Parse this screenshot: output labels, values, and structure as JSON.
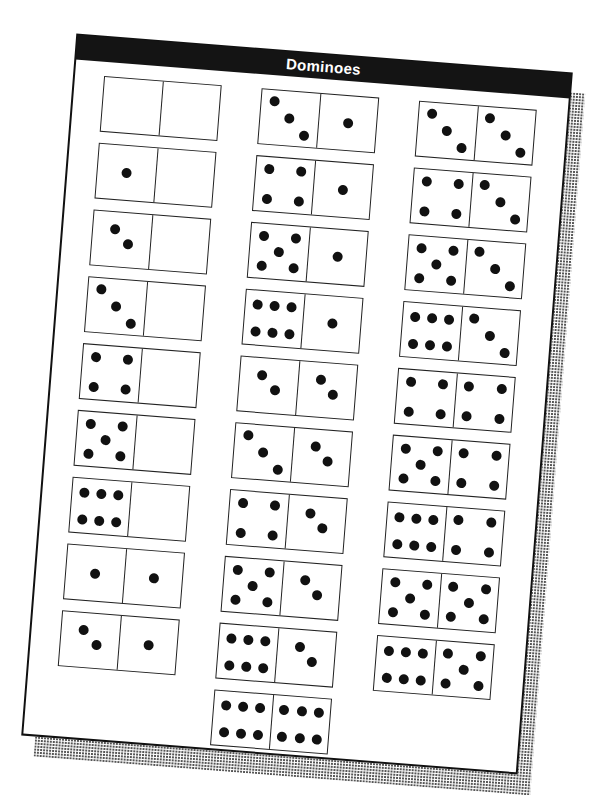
{
  "sheet": {
    "title": "Dominoes",
    "header_color": "#141414",
    "title_color": "#ffffff"
  },
  "columns": [
    {
      "dominoes": [
        {
          "left": 0,
          "right": 0
        },
        {
          "left": 1,
          "right": 0
        },
        {
          "left": 2,
          "right": 0
        },
        {
          "left": 3,
          "right": 0
        },
        {
          "left": 4,
          "right": 0
        },
        {
          "left": 5,
          "right": 0
        },
        {
          "left": 6,
          "right": 0
        },
        {
          "left": 1,
          "right": 1
        },
        {
          "left": 2,
          "right": 1
        }
      ]
    },
    {
      "dominoes": [
        {
          "left": 3,
          "right": 1
        },
        {
          "left": 4,
          "right": 1
        },
        {
          "left": 5,
          "right": 1
        },
        {
          "left": 6,
          "right": 1
        },
        {
          "left": 2,
          "right": 2
        },
        {
          "left": 3,
          "right": 2
        },
        {
          "left": 4,
          "right": 2
        },
        {
          "left": 5,
          "right": 2
        },
        {
          "left": 6,
          "right": 2
        },
        {
          "left": 6,
          "right": 6
        }
      ]
    },
    {
      "dominoes": [
        {
          "left": 3,
          "right": 3
        },
        {
          "left": 4,
          "right": 3
        },
        {
          "left": 5,
          "right": 3
        },
        {
          "left": 6,
          "right": 3
        },
        {
          "left": 4,
          "right": 4
        },
        {
          "left": 5,
          "right": 4
        },
        {
          "left": 6,
          "right": 4
        },
        {
          "left": 5,
          "right": 5
        },
        {
          "left": 6,
          "right": 5
        }
      ]
    }
  ]
}
